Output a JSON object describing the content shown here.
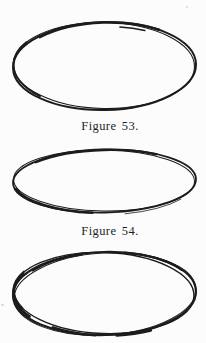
{
  "page": {
    "background_color": "#fcfcfc",
    "ink_color": "#1c1c1c",
    "caption_color": "#1f1f1f"
  },
  "figures": [
    {
      "caption": "Figure 53.",
      "sketch": "hand-drawn-ellipse"
    },
    {
      "caption": "Figure 54.",
      "sketch": "hand-drawn-ellipse"
    },
    {
      "caption": "",
      "sketch": "hand-drawn-ellipse"
    }
  ]
}
